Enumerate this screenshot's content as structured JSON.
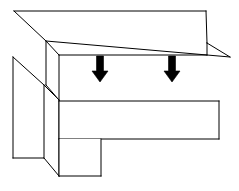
{
  "figure": {
    "title": "",
    "caption": "",
    "background_color": "#ffffff",
    "line_color": "#000000",
    "arrow_color": "#000000",
    "width": 239,
    "height": 191,
    "style": "isometric line drawing"
  },
  "parts": {
    "upper_plate": {
      "name": "upper-plate",
      "label": "",
      "top_face_points": "14,11 206,11 230,57 46,41",
      "front_face_points": "46,41 230,57 230,58 207,58 207,43 46,43",
      "left_face_points": "46,41 46,85 59,100 59,55",
      "front_band_points": "59,55 207,55 207,43 46,43"
    },
    "left_vertical_plate": {
      "name": "left-vertical-plate",
      "label": "",
      "outline_points": "13,57 44,85 44,158 13,158"
    },
    "center_column": {
      "name": "center-column",
      "label": "",
      "outline_points": "44,85 59,100 59,176 44,158"
    },
    "main_beam": {
      "name": "main-beam",
      "label": "",
      "outline_points": "59,101 219,101 219,139 59,139"
    },
    "lower_block": {
      "name": "lower-block",
      "label": "",
      "outline_points": "59,139 101,139 101,176 59,176"
    }
  },
  "annotations": {
    "arrows": [
      {
        "name": "force-arrow-left",
        "label": "",
        "direction": "down",
        "center_x": 100,
        "shaft_top_y": 56,
        "shaft_bottom_y": 71,
        "shaft_half_width": 3.5,
        "head_half_width": 8,
        "tip_y": 82
      },
      {
        "name": "force-arrow-right",
        "label": "",
        "direction": "down",
        "center_x": 172,
        "shaft_top_y": 56,
        "shaft_bottom_y": 71,
        "shaft_half_width": 3.5,
        "head_half_width": 8,
        "tip_y": 82
      }
    ]
  }
}
